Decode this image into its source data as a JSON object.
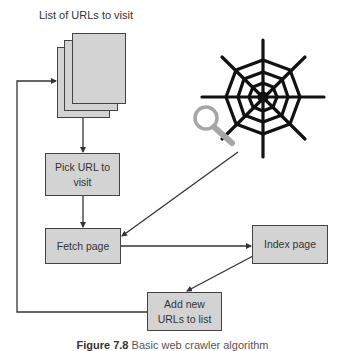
{
  "diagram": {
    "title": "List of URLs to visit",
    "nodes": [
      {
        "id": "url-list",
        "label": "List of URLs to visit",
        "shape": "document-stack"
      },
      {
        "id": "pick",
        "label_line1": "Pick URL to",
        "label_line2": "visit"
      },
      {
        "id": "fetch",
        "label": "Fetch page"
      },
      {
        "id": "index",
        "label": "Index page"
      },
      {
        "id": "add",
        "label_line1": "Add new",
        "label_line2": "URLs to list"
      },
      {
        "id": "web",
        "shape": "spider-web-with-magnifier"
      }
    ],
    "edges": [
      {
        "from": "url-list",
        "to": "pick"
      },
      {
        "from": "pick",
        "to": "fetch"
      },
      {
        "from": "web",
        "to": "fetch"
      },
      {
        "from": "fetch",
        "to": "index"
      },
      {
        "from": "index",
        "to": "add"
      },
      {
        "from": "add",
        "to": "url-list"
      }
    ],
    "caption": {
      "figure": "Figure 7.8",
      "text": "Basic web crawler algorithm"
    },
    "colors": {
      "box_fill": "#d3d3d3",
      "stroke": "#444444",
      "web": "#111111",
      "magnifier": "#a6a6a6"
    }
  }
}
